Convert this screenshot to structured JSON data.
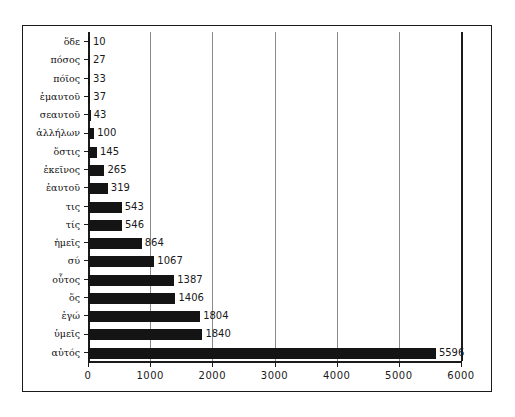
{
  "chart_data": {
    "type": "bar",
    "orientation": "horizontal",
    "title": "",
    "subtitle": "",
    "xlabel": "",
    "ylabel": "",
    "xlim": [
      0,
      6000
    ],
    "xticks": [
      0,
      1000,
      2000,
      3000,
      4000,
      5000,
      6000
    ],
    "xtick_labels": [
      "0",
      "1000",
      "2000",
      "3000",
      "4000",
      "5000",
      "6000"
    ],
    "grid": true,
    "grid_axis": "x",
    "legend": null,
    "legend_position": "none",
    "bar_color": "#141414",
    "show_data_labels": true,
    "categories": [
      "ὅδε",
      "πόσος",
      "πόϊος",
      "ἐμαυτοῦ",
      "σεαυτοῦ",
      "ἀλλήλων",
      "ὅστις",
      "ἐκεῖνος",
      "ἑαυτοῦ",
      "τις",
      "τίς",
      "ἡμεῖς",
      "σύ",
      "οὗτος",
      "ὅς",
      "ἐγώ",
      "ὑμεῖς",
      "αὐτός"
    ],
    "values": [
      10,
      27,
      33,
      37,
      43,
      100,
      145,
      265,
      319,
      543,
      546,
      864,
      1067,
      1387,
      1406,
      1804,
      1840,
      5596
    ],
    "value_labels": [
      "10",
      "27",
      "33",
      "37",
      "43",
      "100",
      "145",
      "265",
      "319",
      "543",
      "546",
      "864",
      "1067",
      "1387",
      "1406",
      "1804",
      "1840",
      "5596"
    ]
  },
  "colors": {
    "bar": "#141414",
    "frame": "#1a1a1a",
    "gridline": "#8a8a8a",
    "background": "#ffffff",
    "text": "#1a1a1a"
  }
}
